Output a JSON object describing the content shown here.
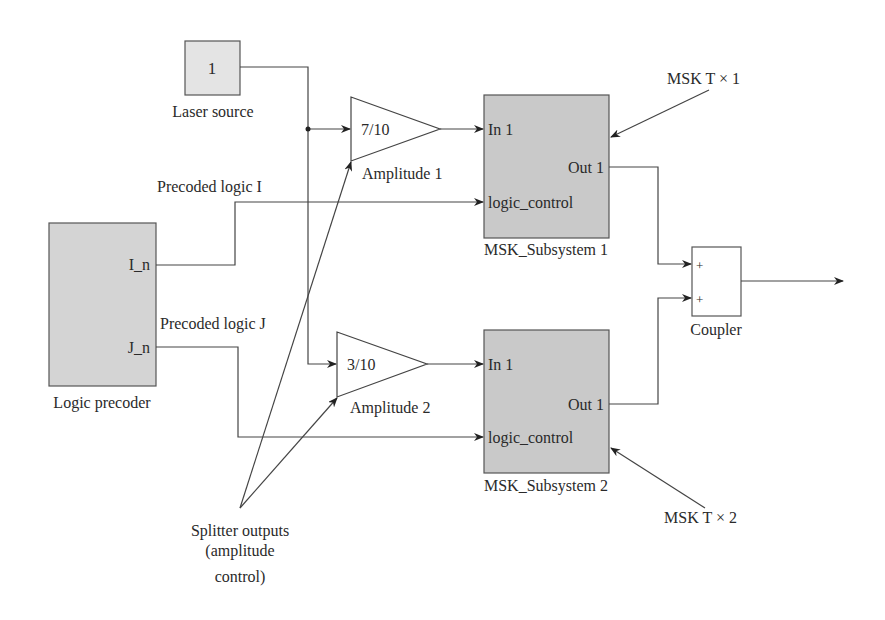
{
  "diagram": {
    "laser_source": {
      "value": "1",
      "label": "Laser source"
    },
    "logic_precoder": {
      "label": "Logic precoder",
      "port_i": "I_n",
      "port_j": "J_n"
    },
    "signals": {
      "precoded_i": "Precoded logic I",
      "precoded_j": "Precoded logic J"
    },
    "amplitude_1": {
      "gain": "7/10",
      "label": "Amplitude 1"
    },
    "amplitude_2": {
      "gain": "3/10",
      "label": "Amplitude 2"
    },
    "subsystem_1": {
      "label": "MSK_Subsystem 1",
      "in": "In 1",
      "out": "Out 1",
      "control": "logic_control"
    },
    "subsystem_2": {
      "label": "MSK_Subsystem 2",
      "in": "In 1",
      "out": "Out 1",
      "control": "logic_control"
    },
    "coupler": {
      "label": "Coupler",
      "plus1": "+",
      "plus2": "+"
    },
    "annotations": {
      "msk_t1": "MSK T × 1",
      "msk_t2": "MSK T × 2",
      "splitter_line1": "Splitter outputs",
      "splitter_line2": "(amplitude",
      "splitter_line3": "control)"
    },
    "colors": {
      "block_fill": "#c9c9c9",
      "light_fill": "#e4e4e4",
      "line": "#333333"
    }
  }
}
